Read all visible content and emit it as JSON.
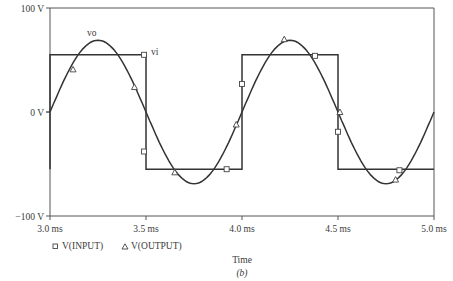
{
  "chart_data": {
    "type": "line",
    "title": "",
    "xlabel": "Time",
    "caption": "(b)",
    "ylabel": "",
    "xlim": [
      3.0,
      5.0
    ],
    "ylim": [
      -100,
      100
    ],
    "x_unit": "ms",
    "y_unit": "V",
    "x_ticks": [
      3.0,
      3.5,
      4.0,
      4.5,
      5.0
    ],
    "x_tick_labels": [
      "3.0 ms",
      "3.5 ms",
      "4.0 ms",
      "4.5 ms",
      "5.0 ms"
    ],
    "y_ticks": [
      100,
      0,
      -100
    ],
    "y_tick_labels": [
      "100 V",
      "0 V",
      "−100 V"
    ],
    "grid": false,
    "legend_placement": "bottom-left",
    "series": [
      {
        "name": "V(INPUT)",
        "annotation": "vi",
        "marker": "square",
        "shape": "square-wave",
        "x": [
          3.0,
          3.0,
          3.5,
          3.5,
          4.0,
          4.0,
          4.5,
          4.5,
          5.0
        ],
        "values": [
          -55,
          55,
          55,
          -55,
          -55,
          55,
          55,
          -55,
          -55
        ],
        "marker_points": [
          {
            "x": 3.49,
            "y": 55
          },
          {
            "x": 3.49,
            "y": -38
          },
          {
            "x": 3.92,
            "y": -55
          },
          {
            "x": 4.0,
            "y": 27
          },
          {
            "x": 4.38,
            "y": 54
          },
          {
            "x": 4.5,
            "y": -19
          },
          {
            "x": 4.82,
            "y": -56
          }
        ]
      },
      {
        "name": "V(OUTPUT)",
        "annotation": "vo",
        "marker": "triangle",
        "shape": "sine",
        "amplitude": 69,
        "period_ms": 1.0,
        "zero_crossing_ms": 3.0,
        "x": [
          3.0,
          3.1,
          3.2,
          3.25,
          3.3,
          3.4,
          3.5,
          3.6,
          3.7,
          3.75,
          3.8,
          3.9,
          4.0,
          4.1,
          4.2,
          4.25,
          4.3,
          4.4,
          4.5,
          4.6,
          4.7,
          4.75,
          4.8,
          4.9,
          5.0
        ],
        "values": [
          -2,
          39,
          65,
          69,
          65,
          40,
          2,
          -38,
          -65,
          -69,
          -66,
          -42,
          -5,
          36,
          64,
          69,
          66,
          43,
          6,
          -34,
          -63,
          -69,
          -66,
          -44,
          -9
        ],
        "marker_points": [
          {
            "x": 3.12,
            "y": 41
          },
          {
            "x": 3.44,
            "y": 24
          },
          {
            "x": 3.65,
            "y": -58
          },
          {
            "x": 3.97,
            "y": -12
          },
          {
            "x": 4.22,
            "y": 70
          },
          {
            "x": 4.51,
            "y": 0
          },
          {
            "x": 4.8,
            "y": -65
          }
        ]
      }
    ]
  }
}
